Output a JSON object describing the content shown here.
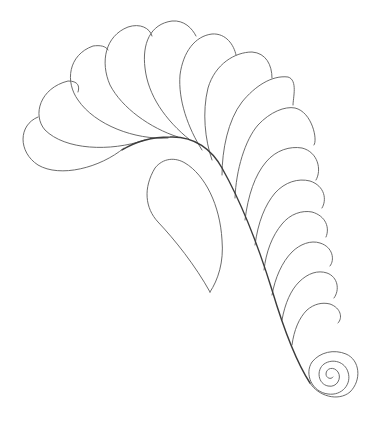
{
  "figure": {
    "title": "Quilting feather pattern line drawing",
    "background_color": "#ffffff",
    "line_color": "#5a5a5a",
    "elements": {
      "spine": "curved feather spine",
      "upper_plumes": 7,
      "right_plumes": 7,
      "separate_teardrop": 1,
      "spiral_end": 1
    }
  }
}
